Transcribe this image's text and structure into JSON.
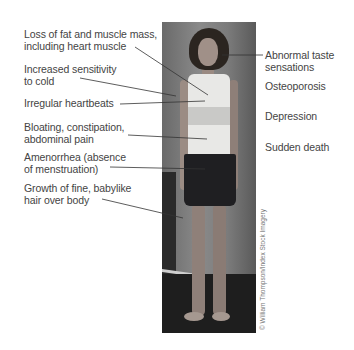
{
  "figure": {
    "left_labels": [
      {
        "line1": "Loss of fat and muscle mass,",
        "line2": "including heart muscle"
      },
      {
        "line1": "Increased sensitivity",
        "line2": "to cold"
      },
      {
        "line1": "Irregular heartbeats",
        "line2": ""
      },
      {
        "line1": "Bloating, constipation,",
        "line2": "abdominal pain"
      },
      {
        "line1": "Amenorrhea (absence",
        "line2": "of menstruation)"
      },
      {
        "line1": "Growth of fine, babylike",
        "line2": "hair over body"
      }
    ],
    "right_labels": [
      {
        "line1": "Abnormal taste",
        "line2": "sensations"
      },
      {
        "line1": "Osteoporosis",
        "line2": ""
      },
      {
        "line1": "Depression",
        "line2": ""
      },
      {
        "line1": "Sudden death",
        "line2": ""
      }
    ],
    "photo_description": "Emaciated woman standing in tank top and shorts",
    "credit": "© William Thompson/Index Stock Imagery",
    "leader_color": "#333333"
  }
}
